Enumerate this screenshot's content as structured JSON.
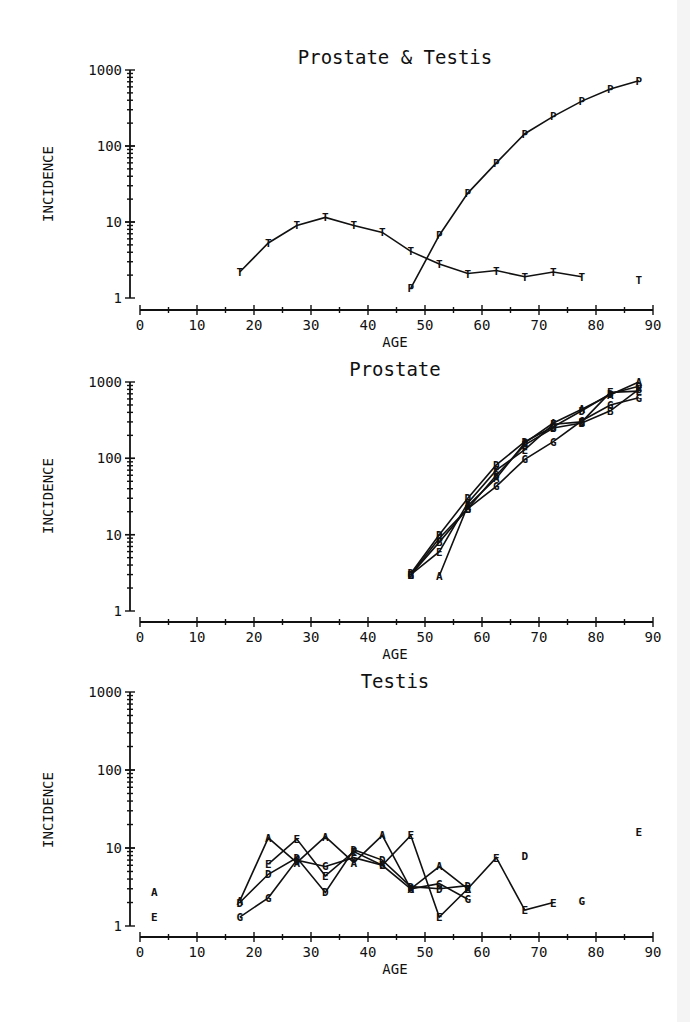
{
  "chart_data": [
    {
      "type": "line",
      "title": "Prostate & Testis",
      "xlabel": "AGE",
      "ylabel": "INCIDENCE",
      "yscale": "log",
      "xlim": [
        0,
        90
      ],
      "ylim": [
        1,
        1000
      ],
      "xticks": [
        "0",
        "10",
        "20",
        "30",
        "40",
        "50",
        "60",
        "70",
        "80",
        "90"
      ],
      "yticks": [
        "1",
        "10",
        "100",
        "1000"
      ],
      "grid": false,
      "series": [
        {
          "name": "T",
          "marker": "T",
          "x": [
            17.5,
            22.5,
            27.5,
            32.5,
            37.5,
            42.5,
            47.5,
            52.5,
            57.5,
            62.5,
            67.5,
            72.5,
            77.5
          ],
          "values": [
            2.2,
            5.3,
            9.0,
            11.5,
            9.0,
            7.3,
            4.1,
            2.8,
            2.1,
            2.3,
            1.9,
            2.2,
            1.9
          ],
          "isolated": [
            {
              "x": 87.5,
              "y": 1.7
            }
          ]
        },
        {
          "name": "P",
          "marker": "P",
          "x": [
            47.5,
            52.5,
            57.5,
            62.5,
            67.5,
            72.5,
            77.5,
            82.5,
            87.5
          ],
          "values": [
            1.35,
            6.7,
            24,
            60,
            145,
            245,
            390,
            560,
            720
          ]
        }
      ]
    },
    {
      "type": "line",
      "title": "Prostate",
      "xlabel": "AGE",
      "ylabel": "INCIDENCE",
      "yscale": "log",
      "xlim": [
        0,
        90
      ],
      "ylim": [
        1,
        1000
      ],
      "xticks": [
        "0",
        "10",
        "20",
        "30",
        "40",
        "50",
        "60",
        "70",
        "80",
        "90"
      ],
      "yticks": [
        "1",
        "10",
        "100",
        "1000"
      ],
      "grid": false,
      "series": [
        {
          "name": "A",
          "marker": "A",
          "x": [
            52.5,
            57.5,
            62.5,
            67.5,
            72.5,
            77.5,
            82.5,
            87.5
          ],
          "values": [
            2.9,
            24,
            55,
            160,
            290,
            440,
            680,
            1000
          ]
        },
        {
          "name": "B",
          "marker": "B",
          "x": [
            47.5,
            52.5,
            57.5,
            62.5,
            67.5,
            72.5,
            77.5,
            82.5,
            87.5
          ],
          "values": [
            3.0,
            8.0,
            22,
            60,
            150,
            250,
            290,
            420,
            800
          ]
        },
        {
          "name": "D",
          "marker": "D",
          "x": [
            47.5,
            52.5,
            57.5,
            62.5,
            67.5,
            72.5,
            77.5,
            82.5,
            87.5
          ],
          "values": [
            3.1,
            10,
            30,
            82,
            165,
            260,
            420,
            700,
            880
          ]
        },
        {
          "name": "E",
          "marker": "E",
          "x": [
            47.5,
            52.5,
            57.5,
            62.5,
            67.5,
            72.5,
            77.5,
            82.5,
            87.5
          ],
          "values": [
            3.0,
            6.0,
            26,
            70,
            130,
            280,
            300,
            730,
            760
          ]
        },
        {
          "name": "G",
          "marker": "G",
          "x": [
            47.5,
            52.5,
            57.5,
            62.5,
            67.5,
            72.5,
            77.5,
            82.5,
            87.5
          ],
          "values": [
            3.0,
            9.0,
            22,
            43,
            97,
            165,
            310,
            500,
            620
          ]
        }
      ]
    },
    {
      "type": "line",
      "title": "Testis",
      "xlabel": "AGE",
      "ylabel": "INCIDENCE",
      "yscale": "log",
      "xlim": [
        0,
        90
      ],
      "ylim": [
        1,
        1000
      ],
      "xticks": [
        "0",
        "10",
        "20",
        "30",
        "40",
        "50",
        "60",
        "70",
        "80",
        "90"
      ],
      "yticks": [
        "1",
        "10",
        "100",
        "1000"
      ],
      "grid": false,
      "series": [
        {
          "name": "A",
          "marker": "A",
          "x": [
            17.5,
            22.5,
            27.5,
            32.5,
            37.5,
            42.5,
            47.5,
            52.5,
            57.5
          ],
          "values": [
            2.1,
            13.5,
            6.5,
            14,
            6.5,
            14.5,
            3.0,
            5.8,
            3.0
          ],
          "isolated": [
            {
              "x": 2.5,
              "y": 2.7
            }
          ]
        },
        {
          "name": "D",
          "marker": "D",
          "x": [
            17.5,
            22.5,
            27.5,
            32.5,
            37.5,
            42.5,
            47.5,
            52.5,
            57.5
          ],
          "values": [
            2.0,
            4.6,
            7.5,
            2.7,
            9.5,
            7.0,
            3.2,
            3.0,
            3.3
          ],
          "isolated": [
            {
              "x": 67.5,
              "y": 8.0
            }
          ]
        },
        {
          "name": "E",
          "marker": "E",
          "x": [
            22.5,
            27.5,
            32.5,
            37.5,
            42.5,
            47.5,
            52.5,
            57.5,
            62.5,
            67.5,
            72.5
          ],
          "values": [
            6.2,
            13,
            4.4,
            9.0,
            6.0,
            14.5,
            1.3,
            3.0,
            7.5,
            1.6,
            2.0
          ],
          "isolated": [
            {
              "x": 2.5,
              "y": 1.3
            },
            {
              "x": 87.5,
              "y": 16
            }
          ]
        },
        {
          "name": "G",
          "marker": "G",
          "x": [
            17.5,
            22.5,
            27.5,
            32.5,
            37.5,
            42.5,
            47.5,
            52.5,
            57.5
          ],
          "values": [
            1.3,
            2.3,
            7.0,
            5.8,
            7.5,
            6.0,
            3.0,
            3.5,
            2.2
          ],
          "isolated": [
            {
              "x": 77.5,
              "y": 2.1
            }
          ]
        }
      ]
    }
  ]
}
